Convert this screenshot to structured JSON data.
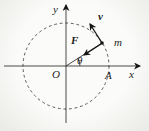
{
  "figure": {
    "width": 149,
    "height": 131,
    "background_center": "#fbfbf9",
    "background_edge": "#e9e9e6",
    "ink_color": "#2b2b2b",
    "vector_color": "#151515"
  },
  "axes": {
    "x_axis": {
      "x1": 4,
      "y1": 66,
      "x2": 140,
      "y2": 66,
      "label": "x"
    },
    "y_axis": {
      "x1": 66,
      "y1": 123,
      "x2": 66,
      "y2": 5,
      "label": "y"
    }
  },
  "circle": {
    "cx": 66,
    "cy": 66,
    "r": 43,
    "dash": "2.8,2.8"
  },
  "radius_line": {
    "x1": 66,
    "y1": 66,
    "x2": 102,
    "y2": 43
  },
  "vectors": {
    "velocity": {
      "x1": 102,
      "y1": 43,
      "x2": 90,
      "y2": 24,
      "label": "v"
    },
    "force": {
      "x1": 101,
      "y1": 44,
      "x2": 84,
      "y2": 55,
      "label": "F"
    }
  },
  "particle": {
    "cx": 102,
    "cy": 43,
    "r": 1.8,
    "label": "m"
  },
  "angle": {
    "label": "θ",
    "arc_path": "M 80 66 A 14 14 0 0 0 77.7 58.4",
    "value_deg": 33
  },
  "labels": {
    "y_axis": {
      "text": "y",
      "x": 53,
      "y": 13
    },
    "x_axis": {
      "text": "x",
      "x": 129,
      "y": 78
    },
    "origin": {
      "text": "O",
      "x": 52,
      "y": 78
    },
    "point_a": {
      "text": "A",
      "x": 105,
      "y": 79
    },
    "theta": {
      "text": "θ",
      "x": 77,
      "y": 64
    },
    "force": {
      "text": "F",
      "x": 71,
      "y": 44
    },
    "velocity": {
      "text": "v",
      "x": 98,
      "y": 20
    },
    "mass": {
      "text": "m",
      "x": 114,
      "y": 46
    }
  }
}
